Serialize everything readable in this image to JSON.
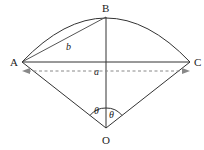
{
  "diagram": {
    "type": "geometry-circular-sector",
    "points": {
      "A": {
        "label": "A",
        "x": 22,
        "y": 62
      },
      "B": {
        "label": "B",
        "x": 106,
        "y": 17
      },
      "C": {
        "label": "C",
        "x": 190,
        "y": 62
      },
      "O": {
        "label": "O",
        "x": 106,
        "y": 128
      }
    },
    "segments": [
      {
        "from": "A",
        "to": "B",
        "label": "b"
      },
      {
        "from": "A",
        "to": "C"
      },
      {
        "from": "B",
        "to": "O"
      },
      {
        "from": "A",
        "to": "O"
      },
      {
        "from": "C",
        "to": "O"
      }
    ],
    "arc": {
      "from": "A",
      "through": "B",
      "to": "C"
    },
    "dimension": {
      "label": "a",
      "style": "dashed-double-arrow",
      "spans": "A to C"
    },
    "angles": [
      {
        "label": "θ",
        "between": [
          "OA",
          "OB"
        ]
      },
      {
        "label": "θ",
        "between": [
          "OB",
          "OC"
        ]
      }
    ]
  },
  "labels": {
    "A": "A",
    "B": "B",
    "C": "C",
    "O": "O",
    "chord_ab": "b",
    "chord_ac": "a",
    "angle_left": "θ",
    "angle_right": "θ"
  }
}
